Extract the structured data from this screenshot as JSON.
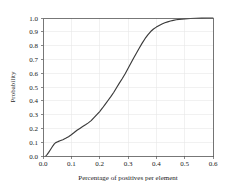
{
  "chart_data": {
    "type": "line",
    "title": "",
    "subtitle": "",
    "xlabel": "Percentage of positives per element",
    "ylabel": "Probability",
    "xlim": [
      0.0,
      0.6
    ],
    "ylim": [
      0.0,
      1.0
    ],
    "grid": true,
    "legend": null,
    "legend_position": "none",
    "xticks": [
      "0.0",
      "0.1",
      "0.2",
      "0.3",
      "0.4",
      "0.5",
      "0.6"
    ],
    "xtick_values": [
      0.0,
      0.1,
      0.2,
      0.3,
      0.4,
      0.5,
      0.6
    ],
    "yticks": [
      "0.0",
      "0.1",
      "0.2",
      "0.3",
      "0.4",
      "0.5",
      "0.6",
      "0.7",
      "0.8",
      "0.9",
      "1.0"
    ],
    "ytick_values": [
      0.0,
      0.1,
      0.2,
      0.3,
      0.4,
      0.5,
      0.6,
      0.7,
      0.8,
      0.9,
      1.0
    ],
    "series": [
      {
        "name": "Cumulative probability",
        "color": "#3a3a3a",
        "x": [
          0.01,
          0.015,
          0.02,
          0.025,
          0.03,
          0.035,
          0.04,
          0.045,
          0.05,
          0.055,
          0.06,
          0.065,
          0.07,
          0.075,
          0.08,
          0.085,
          0.09,
          0.095,
          0.1,
          0.11,
          0.12,
          0.13,
          0.14,
          0.15,
          0.16,
          0.17,
          0.18,
          0.19,
          0.2,
          0.21,
          0.22,
          0.23,
          0.24,
          0.25,
          0.26,
          0.27,
          0.28,
          0.29,
          0.3,
          0.31,
          0.32,
          0.33,
          0.34,
          0.35,
          0.36,
          0.37,
          0.38,
          0.39,
          0.4,
          0.41,
          0.42,
          0.43,
          0.44,
          0.45,
          0.46,
          0.47,
          0.48,
          0.49,
          0.5,
          0.52,
          0.54,
          0.56,
          0.58,
          0.6
        ],
        "y": [
          0.0,
          0.012,
          0.026,
          0.042,
          0.058,
          0.074,
          0.088,
          0.097,
          0.102,
          0.106,
          0.11,
          0.114,
          0.118,
          0.123,
          0.128,
          0.134,
          0.14,
          0.147,
          0.154,
          0.17,
          0.187,
          0.2,
          0.213,
          0.226,
          0.24,
          0.256,
          0.278,
          0.3,
          0.322,
          0.348,
          0.376,
          0.404,
          0.432,
          0.462,
          0.496,
          0.53,
          0.562,
          0.596,
          0.634,
          0.672,
          0.71,
          0.746,
          0.782,
          0.818,
          0.85,
          0.878,
          0.902,
          0.92,
          0.934,
          0.946,
          0.956,
          0.965,
          0.972,
          0.978,
          0.983,
          0.987,
          0.99,
          0.992,
          0.994,
          0.996,
          0.998,
          0.999,
          1.0,
          1.0
        ]
      }
    ]
  },
  "figure": {
    "background_color": "#ffffff",
    "axis_color": "#555555",
    "grid_color": "#e8e8e8",
    "text_color": "#1a1a1a"
  }
}
